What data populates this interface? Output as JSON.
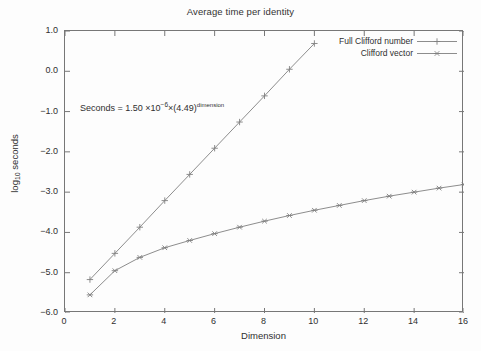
{
  "chart_data": {
    "type": "line",
    "title": "Average time per identity",
    "xlabel": "Dimension",
    "ylabel": "log10 seconds",
    "ylabel_base": "log",
    "ylabel_sub": "10",
    "ylabel_tail": " seconds",
    "xlim": [
      0,
      16
    ],
    "ylim": [
      -6.0,
      1.0
    ],
    "grid": false,
    "legend_position": "top-right",
    "xticks": [
      0,
      2,
      4,
      6,
      8,
      10,
      12,
      14,
      16
    ],
    "xtick_labels": [
      "0",
      "2",
      "4",
      "6",
      "8",
      "10",
      "12",
      "14",
      "16"
    ],
    "yticks": [
      1.0,
      0.0,
      -1.0,
      -2.0,
      -3.0,
      -4.0,
      -5.0,
      -6.0
    ],
    "ytick_labels": [
      "1.0",
      "0.0",
      "-1.0",
      "-2.0",
      "-3.0",
      "-4.0",
      "-5.0",
      "-6.0"
    ],
    "series": [
      {
        "name": "Full Clifford number",
        "marker": "plus",
        "color": "#808080",
        "x": [
          1,
          2,
          3,
          4,
          5,
          6,
          7,
          8,
          9,
          10
        ],
        "values": [
          -5.17,
          -4.52,
          -3.87,
          -3.21,
          -2.56,
          -1.91,
          -1.26,
          -0.61,
          0.05,
          0.69
        ]
      },
      {
        "name": "Clifford vector",
        "marker": "asterisk",
        "color": "#808080",
        "x": [
          1,
          2,
          3,
          4,
          5,
          6,
          7,
          8,
          9,
          10,
          11,
          12,
          13,
          14,
          15,
          16
        ],
        "values": [
          -5.55,
          -4.95,
          -4.62,
          -4.38,
          -4.2,
          -4.03,
          -3.87,
          -3.72,
          -3.58,
          -3.45,
          -3.33,
          -3.21,
          -3.1,
          -3.0,
          -2.9,
          -2.81
        ]
      }
    ],
    "annotations": [
      {
        "name": "fit-equation",
        "text_prefix": "Seconds = 1.50",
        "text_times1": "×",
        "text_base": "10",
        "text_exp": "−6",
        "text_times2": "×",
        "text_paren": "(4.49)",
        "text_dimexp": "dimension",
        "x": 1.0,
        "y": -1.0
      }
    ]
  }
}
